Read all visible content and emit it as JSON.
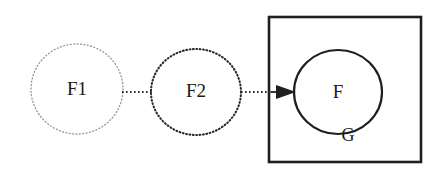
{
  "diagram": {
    "background_color": "#ffffff",
    "nodes": [
      {
        "id": "f1",
        "label": "F1",
        "shape": "circle",
        "border_style": "dotted-faint",
        "color": "#9a9a9a",
        "cx": 77,
        "cy": 89,
        "rx": 46,
        "ry": 45
      },
      {
        "id": "f2",
        "label": "F2",
        "shape": "circle",
        "border_style": "dotted",
        "color": "#2b2b2b",
        "cx": 196,
        "cy": 92,
        "rx": 45,
        "ry": 43
      },
      {
        "id": "f",
        "label": "F",
        "shape": "ellipse",
        "border_style": "solid",
        "color": "#1f1f1f",
        "cx": 338,
        "cy": 92,
        "rx": 44,
        "ry": 42
      }
    ],
    "container": {
      "id": "g",
      "label": "G",
      "shape": "rectangle",
      "border_style": "solid",
      "color": "#1f1f1f",
      "x": 269,
      "y": 17,
      "width": 152,
      "height": 145,
      "label_x": 348,
      "label_y": 137
    },
    "edges": [
      {
        "id": "f1-to-f2",
        "from": "f1",
        "to": "f2",
        "style": "dotted",
        "arrowhead": false,
        "x1": 122,
        "x2": 152,
        "y": 92
      },
      {
        "id": "f2-to-f",
        "from": "f2",
        "to": "f",
        "style": "dotted",
        "arrowhead": true,
        "x1": 241,
        "x2": 271,
        "y": 92,
        "arrow_tip_x": 296,
        "arrow_base_x": 276,
        "arrow_half_height": 7
      }
    ]
  }
}
